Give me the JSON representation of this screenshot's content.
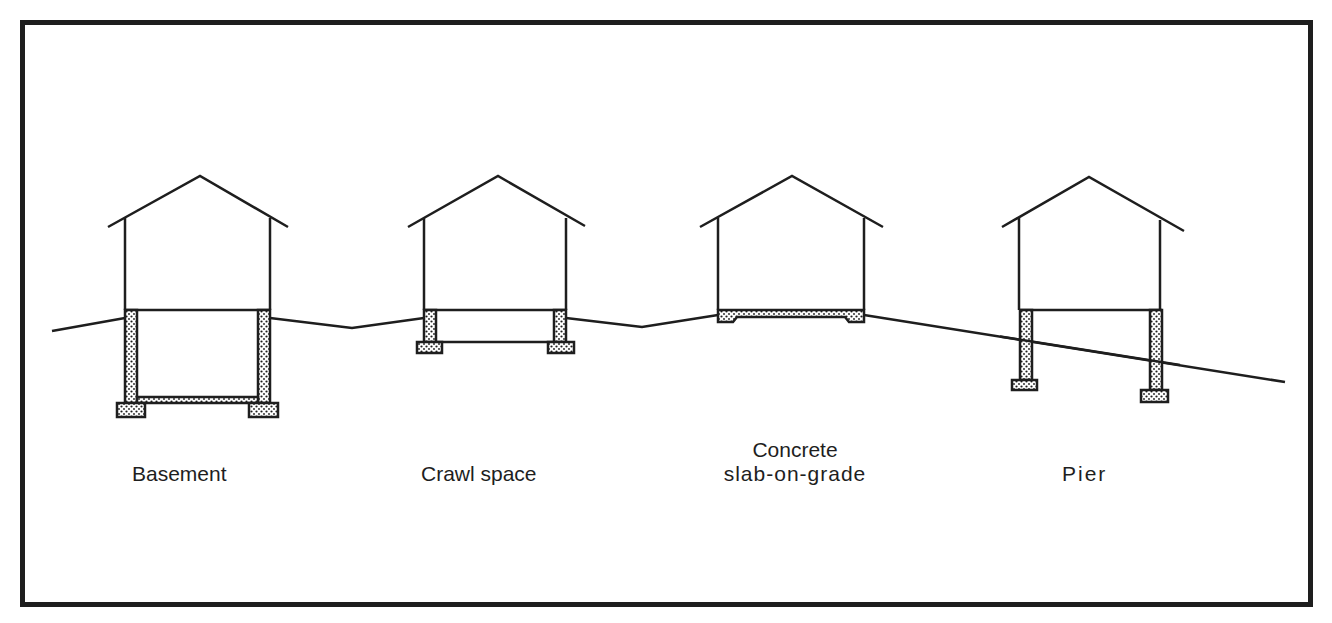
{
  "figure": {
    "colors": {
      "line": "#1e1e1e",
      "background": "#ffffff",
      "concrete_fill": "#ffffff",
      "concrete_dots": "#1e1e1e"
    }
  },
  "foundations": [
    {
      "id": "basement",
      "label": "Basement"
    },
    {
      "id": "crawl-space",
      "label": "Crawl space"
    },
    {
      "id": "slab",
      "label_line1": "Concrete",
      "label_line2": "slab-on-grade"
    },
    {
      "id": "pier",
      "label": "Pier"
    }
  ]
}
